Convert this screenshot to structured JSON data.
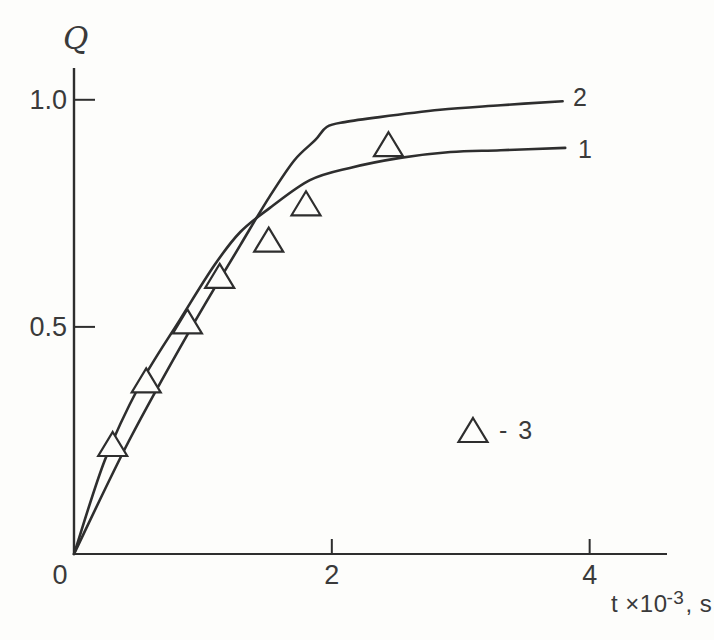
{
  "figure": {
    "background": "#fdfdfb"
  },
  "chart_data": {
    "type": "line+scatter",
    "title": "",
    "ylabel": "Q",
    "xlabel": {
      "base": "t ×10",
      "sup": "-3",
      "suffix": ", s"
    },
    "xlim": [
      0,
      4.6
    ],
    "ylim": [
      0,
      1.07
    ],
    "grid": false,
    "line_color": "#2e2e2e",
    "marker_fill": "#fdfdfb",
    "xticks": [
      {
        "value": 0,
        "label": "0"
      },
      {
        "value": 2,
        "label": "2"
      },
      {
        "value": 4,
        "label": "4"
      }
    ],
    "yticks": [
      {
        "value": 0.5,
        "label": "0.5"
      },
      {
        "value": 1.0,
        "label": "1.0"
      }
    ],
    "series": [
      {
        "name": "1",
        "type": "line",
        "points": [
          [
            0,
            0
          ],
          [
            0.24,
            0.207
          ],
          [
            0.51,
            0.372
          ],
          [
            0.82,
            0.515
          ],
          [
            1.09,
            0.636
          ],
          [
            1.29,
            0.709
          ],
          [
            1.52,
            0.762
          ],
          [
            1.83,
            0.823
          ],
          [
            2.14,
            0.85
          ],
          [
            2.53,
            0.872
          ],
          [
            2.92,
            0.885
          ],
          [
            3.31,
            0.889
          ],
          [
            3.81,
            0.894
          ]
        ]
      },
      {
        "name": "2",
        "type": "line",
        "points": [
          [
            0,
            0
          ],
          [
            0.43,
            0.251
          ],
          [
            0.9,
            0.493
          ],
          [
            1.29,
            0.68
          ],
          [
            1.52,
            0.788
          ],
          [
            1.71,
            0.867
          ],
          [
            1.87,
            0.911
          ],
          [
            1.96,
            0.94
          ],
          [
            2.1,
            0.951
          ],
          [
            2.37,
            0.962
          ],
          [
            2.84,
            0.978
          ],
          [
            3.31,
            0.988
          ],
          [
            3.79,
            0.997
          ]
        ]
      },
      {
        "name": "3",
        "type": "scatter",
        "marker": "triangle-up",
        "points": [
          [
            0.3,
            0.24
          ],
          [
            0.56,
            0.38
          ],
          [
            0.88,
            0.51
          ],
          [
            1.13,
            0.61
          ],
          [
            1.51,
            0.69
          ],
          [
            1.8,
            0.77
          ],
          [
            2.44,
            0.9
          ]
        ]
      }
    ],
    "legend": {
      "marker": "triangle-up",
      "text": "- 3"
    }
  }
}
